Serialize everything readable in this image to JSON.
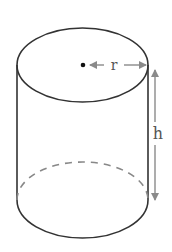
{
  "figure": {
    "labels": {
      "radius": "r",
      "height": "h"
    },
    "colors": {
      "outline": "#333333",
      "dashed": "#888888",
      "arrow": "#8a8a8a",
      "label": "#555555"
    }
  }
}
